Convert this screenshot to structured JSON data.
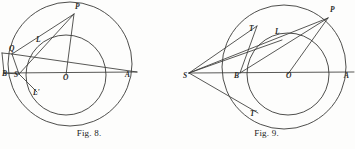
{
  "page": {
    "background_color": "#fdfdfc",
    "ink_color": "#3a3a38",
    "figure_count": 2
  },
  "figures": [
    {
      "id": "fig8",
      "caption": "Fig. 8.",
      "description": "Two concentric-offset circles with chords and labelled points",
      "labels": [
        {
          "text": "P",
          "x": 75,
          "y": 9
        },
        {
          "text": "L",
          "x": 36,
          "y": 42
        },
        {
          "text": "Q",
          "x": 9,
          "y": 51
        },
        {
          "text": "B",
          "x": 4,
          "y": 76
        },
        {
          "text": "S",
          "x": 15,
          "y": 77
        },
        {
          "text": "L'",
          "x": 33,
          "y": 94
        },
        {
          "text": "O",
          "x": 64,
          "y": 79
        },
        {
          "text": "A",
          "x": 126,
          "y": 77
        }
      ],
      "circles": [
        {
          "name": "outer-circle",
          "cx": 70,
          "cy": 64,
          "r": 62
        },
        {
          "name": "inner-circle",
          "cx": 66,
          "cy": 75,
          "r": 40
        }
      ],
      "lines": [
        {
          "name": "line-diameter-BA",
          "x1": 4,
          "y1": 73,
          "x2": 137,
          "y2": 72
        },
        {
          "name": "line-OP",
          "x1": 66,
          "y1": 75,
          "x2": 74,
          "y2": 14
        },
        {
          "name": "line-SP",
          "x1": 19,
          "y1": 74,
          "x2": 74,
          "y2": 14
        },
        {
          "name": "line-QP",
          "x1": 12,
          "y1": 54,
          "x2": 74,
          "y2": 14
        },
        {
          "name": "line-QS",
          "x1": 12,
          "y1": 54,
          "x2": 19,
          "y2": 74
        },
        {
          "name": "line-QA",
          "x1": 12,
          "y1": 54,
          "x2": 137,
          "y2": 72
        },
        {
          "name": "line-S-Lprime",
          "x1": 19,
          "y1": 74,
          "x2": 37,
          "y2": 92
        },
        {
          "name": "line-Q-horizontal",
          "x1": 3,
          "y1": 53,
          "x2": 12,
          "y2": 54
        },
        {
          "name": "line-Q-drop",
          "x1": 3,
          "y1": 53,
          "x2": 4,
          "y2": 73
        }
      ]
    },
    {
      "id": "fig9",
      "caption": "Fig. 9.",
      "description": "Two offset circles with external point S, tangent lines to T and T-prime",
      "labels": [
        {
          "text": "P",
          "x": 152,
          "y": 12
        },
        {
          "text": "T",
          "x": 71,
          "y": 31
        },
        {
          "text": "L",
          "x": 97,
          "y": 34
        },
        {
          "text": "S",
          "x": 7,
          "y": 78
        },
        {
          "text": "B",
          "x": 57,
          "y": 77
        },
        {
          "text": "O",
          "x": 110,
          "y": 77
        },
        {
          "text": "A",
          "x": 167,
          "y": 78
        },
        {
          "text": "T'",
          "x": 72,
          "y": 115
        }
      ],
      "circles": [
        {
          "name": "outer-circle",
          "cx": 106,
          "cy": 67,
          "r": 62
        },
        {
          "name": "inner-circle",
          "cx": 110,
          "cy": 74,
          "r": 41
        }
      ],
      "lines": [
        {
          "name": "line-axis-SA",
          "x1": 11,
          "y1": 73,
          "x2": 176,
          "y2": 72
        },
        {
          "name": "line-tangent-ST",
          "x1": 11,
          "y1": 73,
          "x2": 79,
          "y2": 26
        },
        {
          "name": "line-tangent-STp",
          "x1": 11,
          "y1": 73,
          "x2": 80,
          "y2": 113
        },
        {
          "name": "line-SP",
          "x1": 11,
          "y1": 73,
          "x2": 150,
          "y2": 18
        },
        {
          "name": "line-SL-chord",
          "x1": 11,
          "y1": 73,
          "x2": 104,
          "y2": 40
        },
        {
          "name": "line-OP",
          "x1": 110,
          "y1": 74,
          "x2": 150,
          "y2": 18
        },
        {
          "name": "line-PB",
          "x1": 150,
          "y1": 18,
          "x2": 62,
          "y2": 73
        },
        {
          "name": "line-T-to-axis",
          "x1": 79,
          "y1": 26,
          "x2": 62,
          "y2": 73
        }
      ]
    }
  ]
}
